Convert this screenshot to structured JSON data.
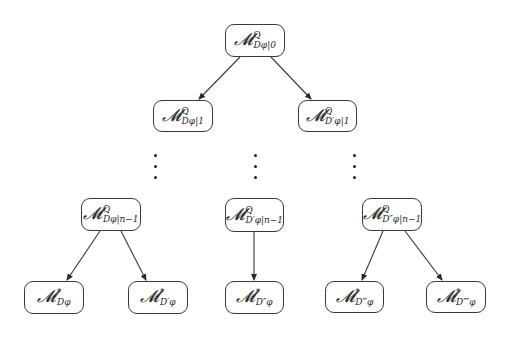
{
  "diagram": {
    "type": "tree",
    "colors": {
      "stroke": "#3a3a3a",
      "text": "#2a2a2a",
      "background": "#ffffff"
    },
    "nodes": [
      {
        "id": "root",
        "symbol": "𝓜",
        "sup": "Q",
        "sub": "Dφ|0",
        "level": 0
      },
      {
        "id": "l1-left",
        "symbol": "𝓜",
        "sup": "Q",
        "sub": "Dφ|1",
        "level": 1
      },
      {
        "id": "l1-right",
        "symbol": "𝓜",
        "sup": "Q",
        "sub": "D′φ|1",
        "level": 1
      },
      {
        "id": "ln-left",
        "symbol": "𝓜",
        "sup": "Q",
        "sub": "Dφ|n−1",
        "level": "n-1"
      },
      {
        "id": "ln-center",
        "symbol": "𝓜",
        "sup": "Q",
        "sub": "D′φ|n−1",
        "level": "n-1"
      },
      {
        "id": "ln-right",
        "symbol": "𝓜",
        "sup": "Q",
        "sub": "D″φ|n−1",
        "level": "n-1"
      },
      {
        "id": "leaf-1",
        "symbol": "𝓜",
        "sup": "*",
        "sub": "Dφ",
        "level": "leaf"
      },
      {
        "id": "leaf-2",
        "symbol": "𝓜",
        "sup": "*",
        "sub": "D′φ",
        "level": "leaf"
      },
      {
        "id": "leaf-3",
        "symbol": "𝓜",
        "sup": "*",
        "sub": "D″φ",
        "level": "leaf"
      },
      {
        "id": "leaf-4",
        "symbol": "𝓜",
        "sup": "*",
        "sub": "D‴φ",
        "level": "leaf"
      },
      {
        "id": "leaf-5",
        "symbol": "𝓜",
        "sup": "*",
        "sub": "D⁗φ",
        "level": "leaf"
      }
    ],
    "edges": [
      {
        "from": "root",
        "to": "l1-left"
      },
      {
        "from": "root",
        "to": "l1-right"
      },
      {
        "from": "ln-left",
        "to": "leaf-1"
      },
      {
        "from": "ln-left",
        "to": "leaf-2"
      },
      {
        "from": "ln-center",
        "to": "leaf-3"
      },
      {
        "from": "ln-right",
        "to": "leaf-4"
      },
      {
        "from": "ln-right",
        "to": "leaf-5"
      }
    ],
    "ellipsis": "⋮"
  }
}
